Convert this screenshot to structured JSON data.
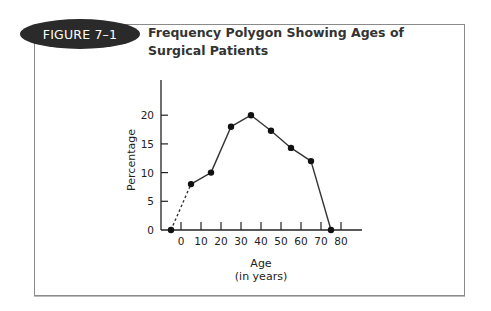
{
  "figure": {
    "badge": "FIGURE 7–1",
    "title": "Frequency Polygon Showing Ages of Surgical Patients"
  },
  "colors": {
    "badge_bg": "#2a2a2a",
    "line": "#333333",
    "frame": "#8a8a8a"
  },
  "chart_data": {
    "type": "line",
    "title": "Frequency Polygon Showing Ages of Surgical Patients",
    "xlabel": "Age",
    "xlabel_sub": "(in years)",
    "ylabel": "Percentage",
    "x_ticks": [
      0,
      10,
      20,
      30,
      40,
      50,
      60,
      70,
      80
    ],
    "y_ticks": [
      0,
      5,
      10,
      15,
      20
    ],
    "xlim": [
      -8,
      88
    ],
    "ylim": [
      0,
      26
    ],
    "grid": false,
    "legend": null,
    "series": [
      {
        "name": "Surgical patients",
        "x": [
          -5,
          5,
          15,
          25,
          35,
          45,
          55,
          65,
          75
        ],
        "values": [
          0,
          8,
          10,
          18,
          20,
          17.3,
          14.3,
          12,
          0
        ],
        "dashed_segments": [
          [
            0,
            1
          ]
        ]
      }
    ]
  }
}
